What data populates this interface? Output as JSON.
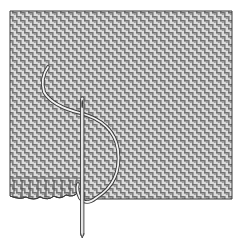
{
  "figure": {
    "type": "illustration",
    "elements": [
      "fabric-swatch",
      "needle",
      "thread",
      "hem-stitches"
    ],
    "colors": {
      "background": "#ffffff",
      "fabric_light": "#e4e4e4",
      "fabric_dark": "#7a7a7a",
      "outline": "#3a3a3a",
      "thread": "#f2f2f2",
      "needle": "#d8d8d8"
    }
  }
}
